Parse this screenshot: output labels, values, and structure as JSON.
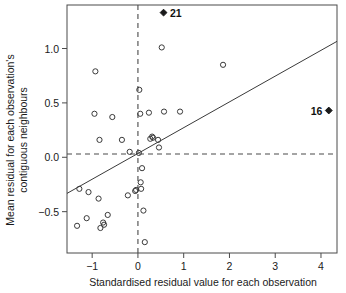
{
  "chart_data": {
    "type": "scatter",
    "title": "",
    "xlabel": "Standardised residual value for each observation",
    "ylabel": "Mean residual for each observation's contiguous neighbours",
    "ylabel_line1": "Mean residual for each observation's",
    "ylabel_line2": "contiguous neighbours",
    "xlim": [
      -1.55,
      4.35
    ],
    "ylim": [
      -0.88,
      1.4
    ],
    "xticks": [
      -1,
      0,
      1,
      2,
      3,
      4
    ],
    "xticklabels": [
      "−1",
      "0",
      "1",
      "2",
      "3",
      "4"
    ],
    "yticks": [
      -0.5,
      0.0,
      0.5,
      1.0
    ],
    "yticklabels": [
      "−0.5",
      "0.0",
      "0.5",
      "1.0"
    ],
    "grid": false,
    "legend": null,
    "reference_lines": [
      {
        "name": "vertical-mean-line",
        "orientation": "vertical",
        "value": 0.0,
        "style": "dashed"
      },
      {
        "name": "horizontal-mean-line",
        "orientation": "horizontal",
        "value": 0.03,
        "style": "dashed"
      }
    ],
    "fit_line": {
      "name": "regression-line",
      "slope": 0.237,
      "intercept": 0.035,
      "x_start": -1.55,
      "y_start": -0.332,
      "x_end": 4.35,
      "y_end": 1.066
    },
    "points": [
      {
        "x": -1.33,
        "y": -0.63
      },
      {
        "x": -1.28,
        "y": -0.29
      },
      {
        "x": -1.12,
        "y": -0.56
      },
      {
        "x": -1.08,
        "y": -0.32
      },
      {
        "x": -0.95,
        "y": 0.4
      },
      {
        "x": -0.93,
        "y": 0.79
      },
      {
        "x": -0.86,
        "y": -0.38
      },
      {
        "x": -0.84,
        "y": 0.16
      },
      {
        "x": -0.82,
        "y": -0.65
      },
      {
        "x": -0.76,
        "y": -0.6
      },
      {
        "x": -0.74,
        "y": -0.62
      },
      {
        "x": -0.66,
        "y": -0.53
      },
      {
        "x": -0.56,
        "y": 0.37
      },
      {
        "x": -0.35,
        "y": 0.16
      },
      {
        "x": -0.22,
        "y": -0.35
      },
      {
        "x": -0.18,
        "y": 0.05
      },
      {
        "x": -0.06,
        "y": -0.31
      },
      {
        "x": -0.04,
        "y": -0.3
      },
      {
        "x": 0.02,
        "y": 0.04
      },
      {
        "x": 0.03,
        "y": 0.62
      },
      {
        "x": 0.05,
        "y": 0.4
      },
      {
        "x": 0.06,
        "y": -0.23
      },
      {
        "x": 0.07,
        "y": -0.29
      },
      {
        "x": 0.09,
        "y": -0.1
      },
      {
        "x": 0.12,
        "y": -0.49
      },
      {
        "x": 0.15,
        "y": -0.78
      },
      {
        "x": 0.24,
        "y": 0.41
      },
      {
        "x": 0.27,
        "y": 0.17
      },
      {
        "x": 0.31,
        "y": 0.19
      },
      {
        "x": 0.33,
        "y": 0.18
      },
      {
        "x": 0.44,
        "y": 0.16
      },
      {
        "x": 0.46,
        "y": 0.09
      },
      {
        "x": 0.52,
        "y": 1.01
      },
      {
        "x": 0.57,
        "y": 0.42
      },
      {
        "x": 0.92,
        "y": 0.42
      },
      {
        "x": 1.86,
        "y": 0.85
      }
    ],
    "labelled_points": [
      {
        "label": "21",
        "x": 0.56,
        "y": 1.33,
        "marker": "filled-diamond",
        "label_position": "right"
      },
      {
        "label": "16",
        "x": 4.17,
        "y": 0.43,
        "marker": "filled-diamond",
        "label_position": "left"
      }
    ]
  }
}
